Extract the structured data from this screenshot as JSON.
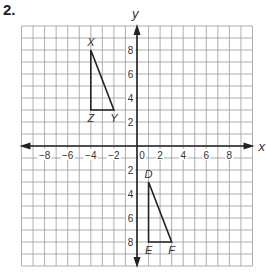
{
  "problem": {
    "number": "2."
  },
  "graph": {
    "x_axis_label": "x",
    "y_axis_label": "y",
    "x_range": [
      -10,
      10
    ],
    "y_range": [
      -10,
      10
    ],
    "x_tick_labels": [
      {
        "value": -8,
        "label": "−8"
      },
      {
        "value": -6,
        "label": "−6"
      },
      {
        "value": -4,
        "label": "−4"
      },
      {
        "value": -2,
        "label": "−2"
      },
      {
        "value": 0,
        "label": "0"
      },
      {
        "value": 2,
        "label": "2"
      },
      {
        "value": 4,
        "label": "4"
      },
      {
        "value": 6,
        "label": "6"
      },
      {
        "value": 8,
        "label": "8"
      }
    ],
    "y_tick_labels": [
      {
        "value": 8,
        "label": "8"
      },
      {
        "value": 6,
        "label": "6"
      },
      {
        "value": 4,
        "label": "4"
      },
      {
        "value": 2,
        "label": "2"
      },
      {
        "value": -2,
        "label": "2"
      },
      {
        "value": -4,
        "label": "4"
      },
      {
        "value": -6,
        "label": "6"
      },
      {
        "value": -8,
        "label": "8"
      }
    ],
    "grid": true,
    "colors": {
      "grid": "#9a9a9a",
      "axis": "#222222",
      "shape": "#222222"
    }
  },
  "triangles": [
    {
      "name": "XYZ",
      "vertices": [
        {
          "label": "X",
          "x": -4,
          "y": 8
        },
        {
          "label": "Y",
          "x": -2,
          "y": 3
        },
        {
          "label": "Z",
          "x": -4,
          "y": 3
        }
      ]
    },
    {
      "name": "DEF",
      "vertices": [
        {
          "label": "D",
          "x": 1,
          "y": -3
        },
        {
          "label": "E",
          "x": 1,
          "y": -8
        },
        {
          "label": "F",
          "x": 3,
          "y": -8
        }
      ]
    }
  ]
}
